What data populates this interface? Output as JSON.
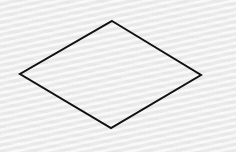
{
  "canvas": {
    "width": 236,
    "height": 152,
    "background_color": "#f1f1f1",
    "background_texture": "wavy-light-gray"
  },
  "shape": {
    "type": "rhombus",
    "fill": "none",
    "stroke": "#111111",
    "stroke_width": 2,
    "points": "112,21 201,75 111,128 20,74"
  }
}
